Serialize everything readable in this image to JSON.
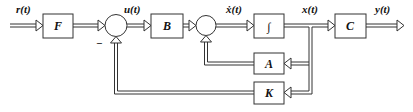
{
  "diagram": {
    "type": "state-feedback control block diagram",
    "blocks": {
      "F": "F",
      "B": "B",
      "integrator": "∫",
      "C": "C",
      "A": "A",
      "K": "K"
    },
    "signals": {
      "input": "r(t)",
      "control": "u(t)",
      "state_derivative": "ẋ(t)",
      "state": "x(t)",
      "output": "y(t)"
    },
    "sum1_sign": "−"
  }
}
